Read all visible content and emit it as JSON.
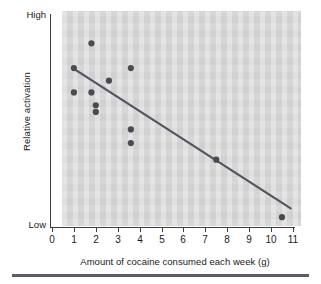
{
  "figure": {
    "y_axis_title": "Relative activation",
    "x_axis_title": "Amount of cocaine consumed each week (g)",
    "y_high_label": "High",
    "y_low_label": "Low"
  },
  "colors": {
    "panel_background": "#d5d5d5",
    "marker": "#4a4a52",
    "trendline": "#545461",
    "axis": "#3d3d3d",
    "rule": "#5a5a6a",
    "text": "#1a1a1a"
  },
  "chart_data": {
    "type": "scatter",
    "title": "",
    "xlabel": "Amount of cocaine consumed each week (g)",
    "ylabel": "Relative activation",
    "xlim": [
      0,
      11
    ],
    "ylim": [
      0,
      100
    ],
    "grid": false,
    "legend": null,
    "xticks": [
      0,
      1,
      2,
      3,
      4,
      5,
      6,
      7,
      8,
      9,
      10,
      11
    ],
    "xticklabels": [
      "0",
      "1",
      "2",
      "3",
      "4",
      "5",
      "6",
      "7",
      "8",
      "9",
      "10",
      "11"
    ],
    "yticklabels": [
      "Low",
      "High"
    ],
    "ytick_positions": [
      0,
      100
    ],
    "points": [
      {
        "x": 1.8,
        "y": 87.0
      },
      {
        "x": 1.0,
        "y": 75.2
      },
      {
        "x": 3.6,
        "y": 75.2
      },
      {
        "x": 2.6,
        "y": 69.2
      },
      {
        "x": 1.0,
        "y": 63.6
      },
      {
        "x": 1.8,
        "y": 63.6
      },
      {
        "x": 2.0,
        "y": 57.5
      },
      {
        "x": 2.0,
        "y": 54.3
      },
      {
        "x": 3.6,
        "y": 46.0
      },
      {
        "x": 3.6,
        "y": 39.5
      },
      {
        "x": 7.5,
        "y": 31.6
      },
      {
        "x": 10.5,
        "y": 4.2
      }
    ],
    "trendline": {
      "label": "best-fit line",
      "x_start": 0.95,
      "y_start": 75.2,
      "x_end": 10.9,
      "y_end": 8.4
    }
  },
  "ticks": [
    {
      "value": "0",
      "px": 52
    },
    {
      "value": "1",
      "px": 74
    },
    {
      "value": "2",
      "px": 96
    },
    {
      "value": "3",
      "px": 118
    },
    {
      "value": "4",
      "px": 140
    },
    {
      "value": "5",
      "px": 162
    },
    {
      "value": "6",
      "px": 183
    },
    {
      "value": "7",
      "px": 205
    },
    {
      "value": "8",
      "px": 227
    },
    {
      "value": "9",
      "px": 249
    },
    {
      "value": "10",
      "px": 271
    },
    {
      "value": "11",
      "px": 293
    }
  ]
}
